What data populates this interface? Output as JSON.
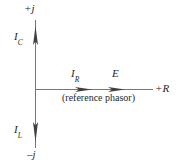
{
  "diagram": {
    "type": "phasor-diagram",
    "axes": {
      "vertical": {
        "positive_label": "+j",
        "negative_label": "–j",
        "name": "imaginary-axis"
      },
      "horizontal": {
        "positive_label": "+R",
        "name": "real-axis"
      }
    },
    "phasors": [
      {
        "key": "ic",
        "label": "I",
        "subscript": "C",
        "direction": "up",
        "axis": "imaginary-positive"
      },
      {
        "key": "il",
        "label": "I",
        "subscript": "L",
        "direction": "down",
        "axis": "imaginary-negative"
      },
      {
        "key": "ir",
        "label": "I",
        "subscript": "R",
        "direction": "right",
        "axis": "real-positive"
      },
      {
        "key": "e",
        "label": "E",
        "subscript": "",
        "direction": "right",
        "axis": "real-positive"
      }
    ],
    "caption": "(reference phasor)",
    "colors": {
      "line": "#6f6f6f",
      "arrow": "#3d3d3d",
      "text": "#1f1f1f",
      "background": "#ffffff"
    }
  }
}
